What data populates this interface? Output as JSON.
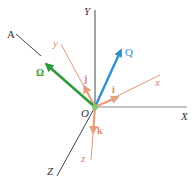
{
  "figure": {
    "type": "3D coordinate frame diagram",
    "origin_label": "O",
    "fixed_axes": {
      "X": "X",
      "Y": "Y",
      "Z": "Z"
    },
    "rotating_axes": {
      "x": "x",
      "y": "y",
      "z": "z"
    },
    "unit_vectors": {
      "i": "i",
      "j": "j",
      "k": "k"
    },
    "vectors": {
      "omega": "Ω",
      "Q": "Q"
    },
    "axis_A": "A",
    "colors": {
      "fixed_axes": "#555555",
      "rotating_axes": "#d98a6a",
      "omega": "#2e9a3c",
      "Q": "#2f8fd0",
      "origin_dot": "#8cc47a"
    }
  }
}
